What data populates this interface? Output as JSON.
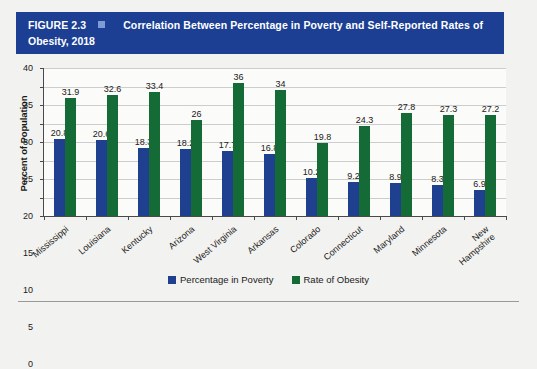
{
  "banner": {
    "figure_label": "FIGURE 2.3",
    "separator_icon": "small-square-icon",
    "title_line1": "Correlation Between Percentage in Poverty and Self-Reported Rates of",
    "title_line2": "Obesity, 2018",
    "background_color": "#1c3f94",
    "text_color": "#ffffff",
    "square_color": "#7d9bd4"
  },
  "chart_data": {
    "type": "bar",
    "title": "Correlation Between Percentage in Poverty and Self-Reported Rates of Obesity, 2018",
    "xlabel": "",
    "ylabel": "Percent of Population",
    "ylim": [
      0,
      40
    ],
    "yticks": [
      0,
      5,
      10,
      15,
      20,
      25,
      30,
      35,
      40
    ],
    "grid": true,
    "legend_position": "bottom-center",
    "categories": [
      "Mississippi",
      "Louisiana",
      "Kentucky",
      "Arizona",
      "West Virginia",
      "Arkansas",
      "Colorado",
      "Connecticut",
      "Maryland",
      "Minnesota",
      "New\nHampshire"
    ],
    "series": [
      {
        "name": "Percentage in Poverty",
        "color": "#1f3f8f",
        "values": [
          20.8,
          20.6,
          18.3,
          18.2,
          17.7,
          16.8,
          10.2,
          9.2,
          8.9,
          8.3,
          6.9
        ]
      },
      {
        "name": "Rate of Obesity",
        "color": "#146b35",
        "values": [
          31.9,
          32.6,
          33.4,
          26,
          36,
          34,
          19.8,
          24.3,
          27.8,
          27.3,
          27.2
        ]
      }
    ]
  }
}
